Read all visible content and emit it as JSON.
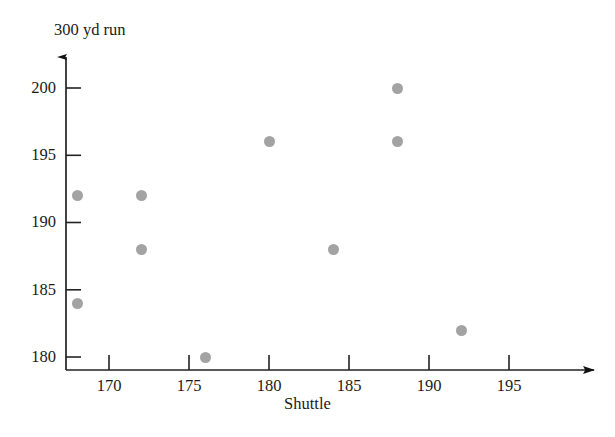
{
  "chart_data": {
    "type": "scatter",
    "title": "",
    "xlabel": "Shuttle",
    "ylabel": "300 yd run",
    "xlim": [
      166.5,
      197.5
    ],
    "ylim": [
      178.3,
      201.5
    ],
    "xticks": [
      170,
      175,
      180,
      185,
      190,
      195
    ],
    "yticks": [
      180,
      185,
      190,
      195,
      200
    ],
    "xtick_labels": [
      "170",
      "175",
      "180",
      "185",
      "190",
      "195"
    ],
    "ytick_labels": [
      "180",
      "185",
      "190",
      "195",
      "200"
    ],
    "grid": false,
    "legend": "none",
    "marker": {
      "shape": "circle",
      "color": "#a3a3a3",
      "size_px": 11
    },
    "axis_color": "#222222",
    "axis_style": "arrow-tipped L-axes",
    "points": [
      {
        "x": 168,
        "y": 192
      },
      {
        "x": 168,
        "y": 184
      },
      {
        "x": 172,
        "y": 192
      },
      {
        "x": 172,
        "y": 188
      },
      {
        "x": 176,
        "y": 180
      },
      {
        "x": 180,
        "y": 196
      },
      {
        "x": 184,
        "y": 188
      },
      {
        "x": 188,
        "y": 200
      },
      {
        "x": 188,
        "y": 196
      },
      {
        "x": 192,
        "y": 182
      }
    ],
    "series": [
      {
        "name": "Shuttle vs 300 yd run",
        "x": [
          168,
          168,
          172,
          172,
          176,
          180,
          184,
          188,
          188,
          192
        ],
        "values": [
          192,
          184,
          192,
          188,
          180,
          196,
          188,
          200,
          196,
          182
        ]
      }
    ]
  },
  "geometry": {
    "x_axis_y_px": 370,
    "y_axis_x_px": 66,
    "x_pixels_per_unit": 16.0,
    "y_pixels_per_unit": 13.45,
    "x_origin_value": 170,
    "x_origin_px": 109,
    "y_origin_value": 180,
    "y_origin_px": 357
  }
}
